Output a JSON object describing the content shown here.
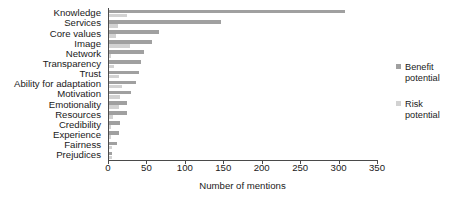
{
  "chart_data": {
    "type": "bar",
    "orientation": "horizontal",
    "title": "",
    "xlabel": "Number of mentions",
    "ylabel": "",
    "xlim": [
      0,
      350
    ],
    "xticks": [
      0,
      50,
      100,
      150,
      200,
      250,
      300,
      350
    ],
    "grid": false,
    "legend_position": "right",
    "categories": [
      "Knowledge",
      "Services",
      "Core values",
      "Image",
      "Network",
      "Transparency",
      "Trust",
      "Ability for adaptation",
      "Motivation",
      "Emotionality",
      "Resources",
      "Credibility",
      "Experience",
      "Fairness",
      "Prejudices"
    ],
    "series": [
      {
        "name": "Benefit potential",
        "color": "#a0a0a0",
        "values": [
          307,
          146,
          65,
          56,
          45,
          42,
          39,
          35,
          28,
          24,
          24,
          14,
          13,
          10,
          4
        ]
      },
      {
        "name": "Risk potential",
        "color": "#d2d2d2",
        "values": [
          24,
          12,
          9,
          27,
          3,
          6,
          13,
          17,
          14,
          13,
          5,
          2,
          2,
          4,
          4
        ]
      }
    ]
  },
  "legend": {
    "entries": [
      {
        "label_line1": "Benefit",
        "label_line2": "potential",
        "color": "#a0a0a0"
      },
      {
        "label_line1": "Risk",
        "label_line2": "potential",
        "color": "#d2d2d2"
      }
    ]
  }
}
